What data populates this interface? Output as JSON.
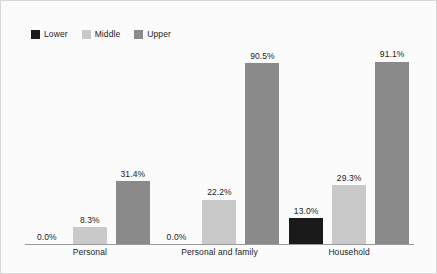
{
  "chart_data": {
    "type": "bar",
    "title": "",
    "subtitle": "",
    "xlabel": "",
    "ylabel": "",
    "ylim": [
      0,
      100
    ],
    "grid": false,
    "legend_position": "top-left",
    "categories": [
      "Personal",
      "Personal and family",
      "Household"
    ],
    "series": [
      {
        "name": "Lower",
        "color": "#1a1a1a",
        "values": [
          0.0,
          0.0,
          13.0
        ],
        "labels": [
          "0.0%",
          "0.0%",
          "13.0%"
        ]
      },
      {
        "name": "Middle",
        "color": "#c9c9c9",
        "values": [
          8.3,
          22.2,
          29.3
        ],
        "labels": [
          "8.3%",
          "22.2%",
          "29.3%"
        ]
      },
      {
        "name": "Upper",
        "color": "#8a8a8a",
        "values": [
          31.4,
          90.5,
          91.1
        ],
        "labels": [
          "31.4%",
          "90.5%",
          "91.1%"
        ]
      }
    ]
  },
  "legend": {
    "items": [
      {
        "label": "Lower",
        "color": "#1a1a1a"
      },
      {
        "label": "Middle",
        "color": "#c9c9c9"
      },
      {
        "label": "Upper",
        "color": "#8a8a8a"
      }
    ]
  },
  "axis": {
    "categories": [
      "Personal",
      "Personal and family",
      "Household"
    ]
  },
  "colors": {
    "background": "#fbfbfb",
    "frame_border": "#d8d8d8",
    "axis_line": "#9a9a9a",
    "text": "#1c1c1c",
    "lower": "#1a1a1a",
    "middle": "#c9c9c9",
    "upper": "#8a8a8a"
  }
}
